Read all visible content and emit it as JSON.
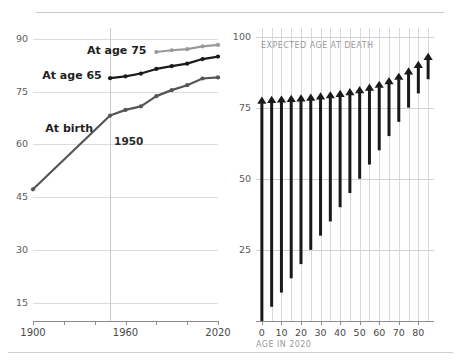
{
  "chart_data": [
    {
      "id": "life-expectancy-trend",
      "type": "line",
      "title": "",
      "xlabel": "",
      "ylabel": "",
      "xlim": [
        1900,
        2020
      ],
      "ylim": [
        10,
        93
      ],
      "xticks": [
        1900,
        1920,
        1940,
        1960,
        1980,
        2000,
        2020
      ],
      "xticklabels": [
        "1900",
        "",
        "",
        "1960",
        "",
        "",
        "2020"
      ],
      "yticks": [
        15,
        30,
        45,
        60,
        75,
        90
      ],
      "yticklabels": [
        "15",
        "30",
        "45",
        "60",
        "75",
        "90"
      ],
      "grid": "horizontal",
      "annotations": [
        {
          "name": "year-marker",
          "text": "1950",
          "x": 1950
        }
      ],
      "series": [
        {
          "name": "At birth",
          "color": "#555555",
          "label_x": 1908,
          "label_y": 64.5,
          "x": [
            1900,
            1950,
            1960,
            1970,
            1980,
            1990,
            2000,
            2010,
            2020
          ],
          "y": [
            47.3,
            68.2,
            69.8,
            70.8,
            73.7,
            75.4,
            76.8,
            78.7,
            79.0
          ]
        },
        {
          "name": "At age 65",
          "color": "#1a1a1a",
          "label_x": 1906,
          "label_y": 79.4,
          "x": [
            1950,
            1960,
            1970,
            1980,
            1990,
            2000,
            2010,
            2020
          ],
          "y": [
            78.8,
            79.3,
            80.1,
            81.4,
            82.2,
            82.9,
            84.2,
            84.9
          ]
        },
        {
          "name": "At age 75",
          "color": "#9a9a9a",
          "label_x": 1935,
          "label_y": 86.4,
          "x": [
            1980,
            1990,
            2000,
            2010,
            2020
          ],
          "y": [
            86.2,
            86.7,
            87.0,
            87.8,
            88.2
          ]
        }
      ]
    },
    {
      "id": "expected-age-at-death-by-current-age",
      "type": "bar",
      "title": "",
      "xlabel": "AGE IN 2020",
      "ylabel": "EXPECTED AGE AT DEATH",
      "xlim": [
        -3,
        88
      ],
      "ylim": [
        0,
        103
      ],
      "xticks": [
        0,
        10,
        20,
        30,
        40,
        50,
        60,
        70,
        80
      ],
      "xticklabels": [
        "0",
        "10",
        "20",
        "30",
        "40",
        "50",
        "60",
        "70",
        "80"
      ],
      "yticks": [
        25,
        50,
        75,
        100
      ],
      "yticklabels": [
        "25",
        "50",
        "75",
        "100"
      ],
      "grid": "both",
      "vgrid_at": [
        0,
        5,
        10,
        15,
        20,
        25,
        30,
        35,
        40,
        45,
        50,
        55,
        60,
        65,
        70,
        75,
        80,
        85
      ],
      "marker": "up-arrow",
      "arrow_color": "#1a1a1a",
      "categories": [
        0,
        5,
        10,
        15,
        20,
        25,
        30,
        35,
        40,
        45,
        50,
        55,
        60,
        65,
        70,
        75,
        80,
        85
      ],
      "base_values": [
        0,
        5,
        10,
        15,
        20,
        25,
        30,
        35,
        40,
        45,
        50,
        55,
        60,
        65,
        70,
        75,
        80,
        85
      ],
      "values": [
        78.9,
        79.2,
        79.3,
        79.5,
        79.7,
        80.0,
        80.4,
        80.8,
        81.3,
        81.9,
        82.6,
        83.5,
        84.5,
        85.8,
        87.3,
        89.2,
        91.5,
        94.3
      ]
    }
  ],
  "left_chart": {
    "series_labels": [
      "At birth",
      "At age 65",
      "At age 75"
    ],
    "year_marker": "1950",
    "x_labels": [
      "1900",
      "1960",
      "2020"
    ],
    "y_labels": [
      "15",
      "30",
      "45",
      "60",
      "75",
      "90"
    ]
  },
  "right_chart": {
    "y_axis_caption": "EXPECTED AGE AT DEATH",
    "x_axis_caption": "AGE IN 2020",
    "y_labels": [
      "25",
      "50",
      "75",
      "100"
    ],
    "x_labels": [
      "0",
      "10",
      "20",
      "30",
      "40",
      "50",
      "60",
      "70",
      "80"
    ]
  }
}
